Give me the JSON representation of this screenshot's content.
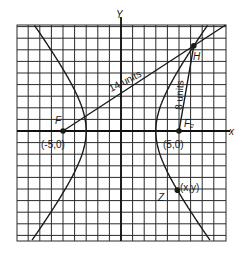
{
  "diagram": {
    "axes": {
      "x_label": "x",
      "y_label": "Y"
    },
    "foci": [
      {
        "name": "F1",
        "label": "F",
        "coord_label": "(-5,0)",
        "x": -5,
        "y": 0
      },
      {
        "name": "F2",
        "label": "F₂",
        "coord_label": "(5,0)",
        "x": 5,
        "y": 0
      }
    ],
    "points": [
      {
        "name": "H",
        "label": "H"
      },
      {
        "name": "Z",
        "label": "Z",
        "coord_label": "(x,y)"
      }
    ],
    "segments": [
      {
        "from": "F1",
        "to": "H",
        "label": "14 units",
        "length": 14
      },
      {
        "from": "F2",
        "to": "H",
        "label": "8 units",
        "length": 8
      }
    ],
    "hyperbola": {
      "a": 3,
      "b": 4,
      "c": 5
    },
    "grid": {
      "x_min": -9,
      "x_max": 9,
      "y_min": -9.5,
      "y_max": 9.1,
      "step": 1
    },
    "colors": {
      "ink": "#1a1a1a",
      "grid": "#2a2a2a",
      "background": "#ffffff"
    }
  }
}
